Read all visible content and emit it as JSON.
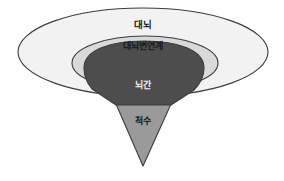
{
  "figure": {
    "title": "",
    "background_color": "#ffffff",
    "width": 284,
    "height": 181
  },
  "diagram": {
    "type": "nested-anatomy-diagram",
    "regions": [
      {
        "id": "cerebrum",
        "label": "대뇌",
        "shape": "ellipse",
        "fill_color": "#f2f2f2",
        "stroke_color": "#3c3c3c",
        "layer": 1,
        "label_color": "#1a1a1a",
        "label_x": 143,
        "label_y": 25,
        "label_size": 9.5,
        "cx": 143,
        "cy": 52,
        "rx": 125,
        "ry": 44
      },
      {
        "id": "limbic-system",
        "label": "대뇌변연계",
        "shape": "ellipse",
        "fill_color": "#d9d9d9",
        "stroke_color": "#3c3c3c",
        "layer": 2,
        "label_color": "#1a1a1a",
        "label_x": 143,
        "label_y": 46,
        "label_size": 9,
        "cx": 145,
        "cy": 63,
        "rx": 73,
        "ry": 27
      },
      {
        "id": "brainstem",
        "label": "뇌간",
        "shape": "fan",
        "fill_color": "#4d4d4d",
        "stroke_color": "#3c3c3c",
        "layer": 3,
        "label_color": "#f0f0f0",
        "label_x": 143,
        "label_y": 85,
        "label_size": 9
      },
      {
        "id": "spinal-cord",
        "label": "척수",
        "shape": "triangle",
        "fill_color": "#9a9a9a",
        "stroke_color": "#3c3c3c",
        "layer": 4,
        "label_color": "#1a1a1a",
        "label_x": 143,
        "label_y": 121,
        "label_size": 9,
        "apex_x": 143,
        "apex_y": 166,
        "top_left_x": 116,
        "top_right_x": 171,
        "top_y": 105
      }
    ]
  }
}
